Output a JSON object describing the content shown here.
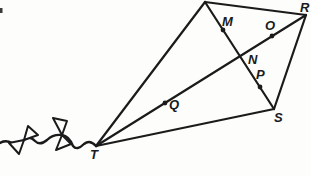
{
  "labels": {
    "R": "R",
    "M": "M",
    "O": "O",
    "N": "N",
    "P": "P",
    "Q": "Q",
    "S": "S",
    "T": "T"
  },
  "colors": {
    "ink": "#1b1b1b",
    "paper": "#fdfdfb"
  },
  "geometry": {
    "vertices": {
      "apex": {
        "x": 205,
        "y": 2
      },
      "R": {
        "x": 306,
        "y": 15
      },
      "S": {
        "x": 274,
        "y": 109
      },
      "T": {
        "x": 96,
        "y": 146
      }
    },
    "diagonal_intersection_N": {
      "x": 240,
      "y": 56
    },
    "tick_dots": [
      {
        "name": "M",
        "x": 223,
        "y": 30
      },
      {
        "name": "O",
        "x": 272,
        "y": 36
      },
      {
        "name": "P",
        "x": 260,
        "y": 87
      },
      {
        "name": "Q",
        "x": 165,
        "y": 103
      }
    ]
  }
}
